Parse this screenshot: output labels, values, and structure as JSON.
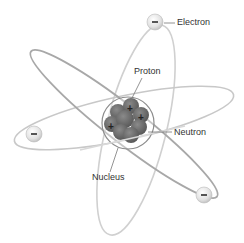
{
  "diagram": {
    "labels": {
      "electron": "Electron",
      "proton": "Proton",
      "neutron": "Neutron",
      "nucleus": "Nucleus"
    },
    "electron_symbol": "−",
    "proton_symbol": "+",
    "colors": {
      "orbit": "#9a9a9a",
      "orbit_light": "#cfcfcf",
      "nucleus_fill": "#6e6e6e",
      "electron_fill": "#e6e6e6",
      "label_text": "#333333",
      "leader_line": "#777777"
    }
  }
}
